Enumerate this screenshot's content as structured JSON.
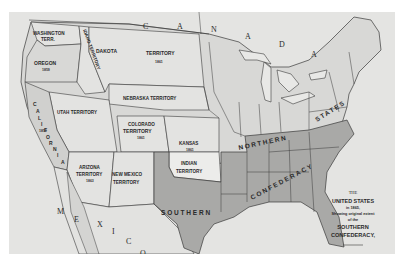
{
  "map": {
    "title_block": {
      "line1": "THE",
      "line2": "UNITED STATES",
      "line3": "in 1865,",
      "line4": "Showing original extent",
      "line5": "of the",
      "line6": "SOUTHERN",
      "line7": "CONFEDERACY,"
    },
    "countries": {
      "canada": [
        "C",
        "A",
        "N",
        "A",
        "D",
        "A"
      ],
      "mexico": [
        "M",
        "E",
        "X",
        "I",
        "C",
        "O"
      ]
    },
    "regions": {
      "washington": {
        "line1": "WASHINGTON",
        "line2": "TERR."
      },
      "idaho": {
        "label": "IDAHO TERRITORY",
        "year": "1863"
      },
      "dakota": {
        "label1": "DAKOTA",
        "label2": "TERRITORY",
        "year": "1861"
      },
      "oregon": {
        "label": "OREGON",
        "year": "1859"
      },
      "nebraska": {
        "label": "NEBRASKA TERRITORY"
      },
      "utah": {
        "label": "UTAH TERRITORY"
      },
      "california": {
        "letters": [
          "C",
          "A",
          "L",
          "I",
          "F",
          "O",
          "R",
          "N",
          "I",
          "A"
        ],
        "year": "1850"
      },
      "colorado": {
        "line1": "COLORADO",
        "line2": "TERRITORY",
        "year": "1861"
      },
      "kansas": {
        "label": "KANSAS",
        "year": "1861"
      },
      "arizona": {
        "line1": "ARIZONA",
        "line2": "TERRITORY",
        "year": "1863"
      },
      "new_mexico": {
        "line1": "NEW MEXICO",
        "line2": "TERRITORY"
      },
      "indian": {
        "line1": "INDIAN",
        "line2": "TERRITORY"
      },
      "northern": {
        "word1": "NORTHERN",
        "word2": "STATES"
      },
      "southern": {
        "word1": "SOUTHERN",
        "word2": "CONFEDERACY"
      }
    },
    "colors": {
      "background": "#e4e4e2",
      "union_fill": "#d9d9d7",
      "territory_fill": "#e8e8e6",
      "confederacy_fill": "#a9a9a7",
      "water": "#e4e4e2",
      "border": "#3a3a3a"
    }
  }
}
